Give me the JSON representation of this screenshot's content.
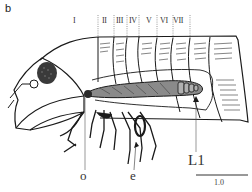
{
  "figure": {
    "panel_label": "b",
    "segments": [
      {
        "label": "I",
        "x": 73
      },
      {
        "label": "II",
        "x": 103
      },
      {
        "label": "III",
        "x": 116
      },
      {
        "label": "IV",
        "x": 128
      },
      {
        "label": "V",
        "x": 145
      },
      {
        "label": "VI",
        "x": 160
      },
      {
        "label": "VII",
        "x": 175
      }
    ],
    "callouts": {
      "o": "o",
      "e": "e",
      "l1": "L1"
    },
    "scale_bar": {
      "label": "1.0"
    },
    "colors": {
      "line": "#1a1a1a",
      "gut_fill": "#8a8a8a",
      "background": "#ffffff"
    }
  }
}
